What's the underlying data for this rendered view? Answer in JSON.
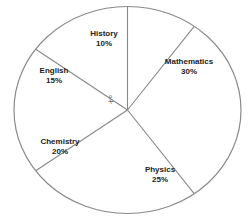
{
  "chart_data": {
    "type": "pie",
    "title": "",
    "slices": [
      {
        "label": "History",
        "value": 10,
        "display": "10%"
      },
      {
        "label": "Mathematics",
        "value": 30,
        "display": "30%"
      },
      {
        "label": "Physics",
        "value": 25,
        "display": "25%"
      },
      {
        "label": "Chemistry",
        "value": 20,
        "display": "20%"
      },
      {
        "label": "English",
        "value": 15,
        "display": "15%"
      }
    ],
    "categories": [
      "History",
      "Mathematics",
      "Physics",
      "Chemistry",
      "English"
    ],
    "values": [
      10,
      30,
      25,
      20,
      15
    ],
    "unit": "%",
    "annotations": [
      {
        "text": "x°",
        "location": "English sector angle at center"
      }
    ],
    "legend": "none (labels inside slices)",
    "fill": "#ffffff",
    "stroke": "#888888"
  },
  "labels": {
    "history": {
      "name": "History",
      "pct": "10%"
    },
    "mathematics": {
      "name": "Mathematics",
      "pct": "30%"
    },
    "physics": {
      "name": "Physics",
      "pct": "25%"
    },
    "chemistry": {
      "name": "Chemistry",
      "pct": "20%"
    },
    "english": {
      "name": "English",
      "pct": "15%"
    },
    "angle_mark": "x°"
  }
}
